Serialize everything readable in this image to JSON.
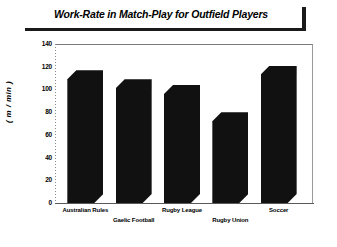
{
  "chart_data": {
    "type": "bar",
    "title": "Work-Rate in Match-Play for Outfield Players",
    "xlabel": "",
    "ylabel": "( m / min )",
    "categories": [
      "Australian Rules",
      "Gaelic Football",
      "Rugby League",
      "Rugby Union",
      "Soccer"
    ],
    "values": [
      117,
      109,
      104,
      80,
      121
    ],
    "ylim": [
      0,
      140
    ],
    "yticks": [
      0,
      20,
      40,
      60,
      80,
      100,
      120,
      140
    ],
    "ytick_labels": [
      "0",
      "20",
      "40",
      "60",
      "80",
      "100",
      "120",
      "140"
    ],
    "grid": false,
    "legend": null,
    "series": [
      {
        "name": "Work-Rate",
        "values": [
          117,
          109,
          104,
          80,
          121
        ]
      }
    ],
    "colors": {
      "bar": "#111111",
      "axis": "#5a5a5a",
      "text": "#000000",
      "background": "#ffffff"
    },
    "label_rows": [
      0,
      1,
      0,
      1,
      0
    ]
  }
}
